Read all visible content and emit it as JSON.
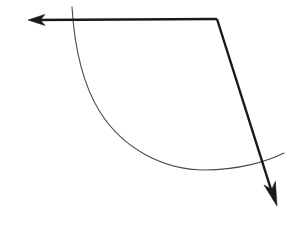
{
  "figure": {
    "width": 294,
    "height": 242,
    "background_color": "#ffffff",
    "stroke_color": "#1a1a1a",
    "arc_color": "#4a4a4a",
    "thick_stroke_width": 2.4,
    "thin_stroke_width": 1.1,
    "elements": {
      "horizontal_ray": {
        "label": "horizontal ray pointing left",
        "from_x": 217,
        "from_y": 19,
        "to_x": 30,
        "to_y": 20
      },
      "diagonal_ray": {
        "label": "diagonal ray pointing down-right",
        "from_x": 217,
        "from_y": 19,
        "to_x": 275,
        "to_y": 202
      },
      "vertex": {
        "label": "corner vertex",
        "x": 217,
        "y": 19
      },
      "left_arrowhead": {
        "label": "left arrowhead",
        "tip_x": 28,
        "tip_y": 20,
        "length": 17,
        "half_width": 5.5
      },
      "bottom_arrowhead": {
        "label": "bottom-right arrowhead",
        "tip_x": 277,
        "tip_y": 206,
        "length": 24,
        "half_width": 6
      },
      "arc": {
        "label": "thin circular arc sweeping from top-left down to right",
        "start_x": 72,
        "start_y": 7,
        "end_x": 284,
        "end_y": 153,
        "lowest_x": 205,
        "lowest_y": 170,
        "path": "M 72 7 C 74 40 80 80 100 112 C 124 150 165 170 205 170 C 237 170 266 162 284 153"
      }
    }
  }
}
